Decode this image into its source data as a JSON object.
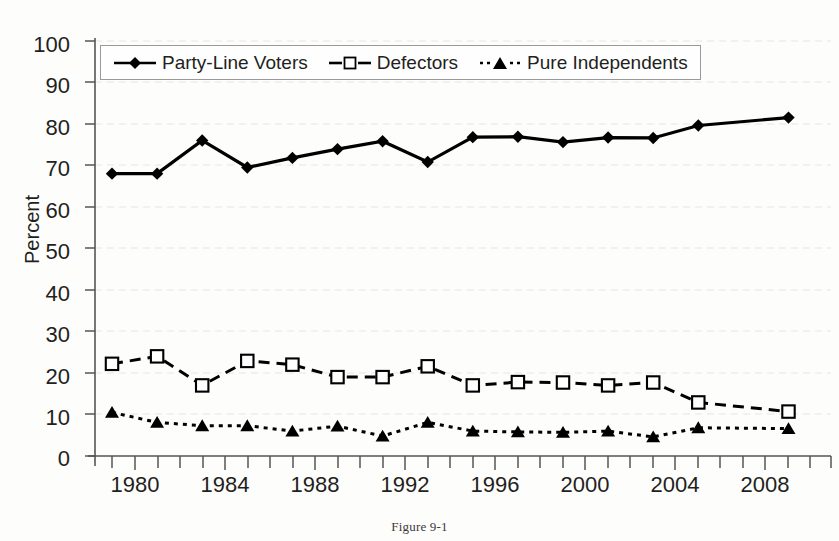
{
  "caption": "Figure 9-1",
  "axis": {
    "ylabel": "Percent",
    "yticks": [
      "0",
      "10",
      "20",
      "30",
      "40",
      "50",
      "60",
      "70",
      "80",
      "90",
      "100"
    ],
    "xticks": [
      "1980",
      "1984",
      "1988",
      "1992",
      "1996",
      "2000",
      "2004",
      "2008"
    ]
  },
  "legend": {
    "entries": [
      {
        "label": "Party-Line Voters",
        "marker": "filled-diamond",
        "line": "solid",
        "color": "#000000"
      },
      {
        "label": "Defectors",
        "marker": "open-square",
        "line": "dashed",
        "color": "#000000"
      },
      {
        "label": "Pure Independents",
        "marker": "filled-triangle",
        "line": "dotted",
        "color": "#000000"
      }
    ]
  },
  "chart_data": {
    "type": "line",
    "title": "",
    "subtitle": "",
    "xlabel": "",
    "ylabel": "Percent",
    "xlim": [
      1977,
      2009
    ],
    "ylim": [
      0,
      100
    ],
    "ytick_step": 10,
    "grid": "horizontal-dashed-light",
    "legend_position": "top-left-inside",
    "x": [
      1978,
      1980,
      1982,
      1984,
      1986,
      1988,
      1990,
      1992,
      1994,
      1996,
      1998,
      2000,
      2002,
      2004,
      2008
    ],
    "xtick_labels": [
      "1980",
      "1984",
      "1988",
      "1992",
      "1996",
      "2000",
      "2004",
      "2008"
    ],
    "xtick_values": [
      1980,
      1984,
      1988,
      1992,
      1996,
      2000,
      2004,
      2008
    ],
    "xtick_minor_values": [
      1978,
      1982,
      1986,
      1990,
      1994,
      1998,
      2002,
      2006
    ],
    "series": [
      {
        "name": "Party-Line Voters",
        "marker": "filled-diamond",
        "line": "solid",
        "color": "#000000",
        "values": [
          68.0,
          68.0,
          76.0,
          69.5,
          71.8,
          73.9,
          75.8,
          70.8,
          76.8,
          76.9,
          75.6,
          76.7,
          76.6,
          79.6,
          81.5
        ]
      },
      {
        "name": "Defectors",
        "marker": "open-square",
        "line": "dashed",
        "color": "#000000",
        "values": [
          22.2,
          24.0,
          17.0,
          22.9,
          22.0,
          19.0,
          19.0,
          21.6,
          17.0,
          17.8,
          17.7,
          17.0,
          17.7,
          12.9,
          10.7
        ]
      },
      {
        "name": "Pure Independents",
        "marker": "filled-triangle",
        "line": "dotted",
        "color": "#000000",
        "values": [
          10.5,
          8.1,
          7.3,
          7.3,
          6.0,
          7.2,
          4.8,
          8.1,
          6.0,
          5.8,
          5.7,
          6.0,
          4.6,
          6.8,
          6.6
        ]
      }
    ]
  },
  "colors": {
    "ink": "#231f20",
    "axis": "#4d4d4d",
    "grid": "#e8e8e8",
    "legend_border": "#9a9a9a",
    "background": "#fdfdfc"
  }
}
